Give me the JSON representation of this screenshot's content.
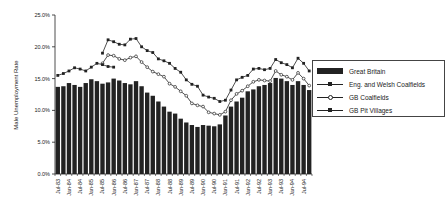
{
  "chart_data": {
    "type": "bar",
    "title": "",
    "xlabel": "",
    "ylabel": "Male Unemployment Rate",
    "ylim": [
      0,
      25
    ],
    "yticks": [
      "0.0%",
      "5.0%",
      "10.0%",
      "15.0%",
      "20.0%",
      "25.0%"
    ],
    "grid": false,
    "legend_position": "right",
    "tick_labels": [
      "Jul-83",
      "Jan-84",
      "Jul-84",
      "Jan-85",
      "Jul-85",
      "Jan-86",
      "Jul-86",
      "Jan-87",
      "Jul-87",
      "Jan-88",
      "Jul-88",
      "Jan-89",
      "Jul-89",
      "Jan-90",
      "Jul-90",
      "Jan-91",
      "Jul-91",
      "Jan-92",
      "Jul-92",
      "Jan-93",
      "Jul-93",
      "Jan-94",
      "Jul-94"
    ],
    "categories": [
      "Jul-83",
      "Oct-83",
      "Jan-84",
      "Apr-84",
      "Jul-84",
      "Oct-84",
      "Jan-85",
      "Apr-85",
      "Jul-85",
      "Oct-85",
      "Jan-86",
      "Apr-86",
      "Jul-86",
      "Oct-86",
      "Jan-87",
      "Apr-87",
      "Jul-87",
      "Oct-87",
      "Jan-88",
      "Apr-88",
      "Jul-88",
      "Oct-88",
      "Jan-89",
      "Apr-89",
      "Jul-89",
      "Oct-89",
      "Jan-90",
      "Apr-90",
      "Jul-90",
      "Oct-90",
      "Jan-91",
      "Apr-91",
      "Jul-91",
      "Oct-91",
      "Jan-92",
      "Apr-92",
      "Jul-92",
      "Oct-92",
      "Jan-93",
      "Apr-93",
      "Jul-93",
      "Oct-93",
      "Jan-94",
      "Apr-94",
      "Jul-94",
      "Oct-94"
    ],
    "series": [
      {
        "name": "Great Britain",
        "kind": "bar",
        "color": "#222222",
        "values": [
          13.7,
          13.8,
          14.3,
          14.0,
          13.7,
          14.3,
          14.9,
          14.6,
          14.2,
          14.4,
          15.0,
          14.7,
          14.3,
          14.1,
          14.6,
          13.8,
          12.8,
          12.3,
          11.4,
          10.6,
          9.8,
          9.5,
          8.7,
          8.1,
          7.7,
          7.4,
          7.7,
          7.6,
          7.5,
          7.8,
          9.2,
          10.6,
          11.4,
          12.0,
          13.0,
          13.3,
          13.8,
          14.0,
          14.3,
          15.1,
          15.0,
          14.6,
          14.0,
          14.6,
          14.0,
          13.2
        ]
      },
      {
        "name": "Eng. and Welsh Coalfields",
        "kind": "line",
        "marker": "filled",
        "color": "#222222",
        "values": [
          null,
          null,
          null,
          null,
          null,
          null,
          null,
          null,
          19.0,
          21.1,
          20.8,
          20.4,
          20.3,
          21.2,
          21.3,
          20.0,
          19.4,
          19.1,
          18.1,
          17.8,
          17.4,
          16.6,
          16.0,
          14.8,
          14.1,
          13.8,
          12.4,
          12.1,
          11.9,
          11.4,
          11.6,
          13.2,
          14.8,
          15.2,
          15.5,
          16.5,
          16.6,
          16.4,
          16.6,
          18.0,
          17.5,
          17.2,
          16.7,
          18.2,
          17.4,
          16.2
        ]
      },
      {
        "name": "GB Coalfields",
        "kind": "line",
        "marker": "open",
        "color": "#222222",
        "values": [
          null,
          null,
          null,
          null,
          null,
          null,
          null,
          null,
          17.4,
          18.7,
          18.6,
          18.1,
          17.9,
          18.3,
          18.5,
          17.6,
          16.8,
          16.1,
          15.7,
          15.3,
          14.2,
          13.7,
          13.0,
          12.3,
          11.1,
          10.8,
          10.6,
          9.7,
          9.5,
          9.3,
          9.8,
          11.6,
          12.6,
          13.1,
          13.8,
          14.5,
          14.8,
          14.7,
          14.6,
          16.2,
          15.6,
          15.3,
          14.8,
          15.9,
          15.0,
          13.9
        ]
      },
      {
        "name": "GB Pit Villages",
        "kind": "line",
        "marker": "filled",
        "color": "#222222",
        "values": [
          15.5,
          15.8,
          16.2,
          16.7,
          16.5,
          16.2,
          16.8,
          17.4,
          17.2,
          16.9,
          16.8,
          null,
          null,
          null,
          null,
          null,
          null,
          null,
          null,
          null,
          null,
          null,
          null,
          null,
          null,
          null,
          null,
          null,
          null,
          null,
          null,
          null,
          null,
          null,
          null,
          null,
          null,
          null,
          null,
          null,
          null,
          null,
          null,
          null,
          null,
          null
        ]
      }
    ]
  },
  "legend": {
    "items": [
      {
        "label": "Great Britain",
        "swatch": "bar"
      },
      {
        "label": "Eng. and Welsh Coalfields",
        "swatch": "line-filled"
      },
      {
        "label": "GB Coalfields",
        "swatch": "line-open"
      },
      {
        "label": "GB Pit Villages",
        "swatch": "line-filled"
      }
    ]
  }
}
